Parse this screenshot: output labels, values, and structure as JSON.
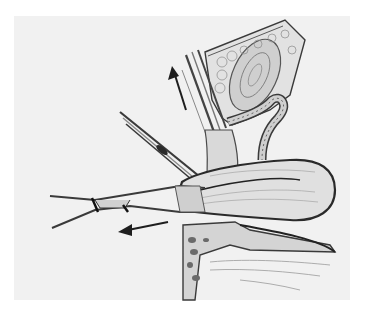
{
  "figure": {
    "signature": "",
    "arrows": [
      {
        "name": "upward-retraction-arrow",
        "direction": "up-left"
      },
      {
        "name": "leftward-traction-arrow",
        "direction": "left"
      }
    ],
    "colors": {
      "background": "#ffffff",
      "panel": "#f1f1f1",
      "ink": "#2a2a2a",
      "tissue": "#d8d8d8",
      "shade": "#9a9a9a"
    }
  }
}
